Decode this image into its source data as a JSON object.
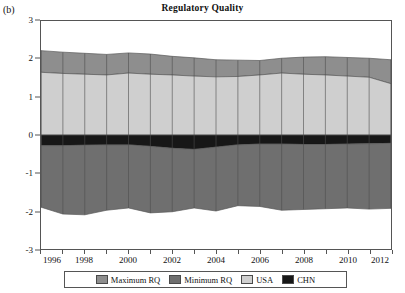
{
  "panel_label": "(b)",
  "chart_data": {
    "type": "area",
    "title": "Regulatory Quality",
    "xlabel": "",
    "ylabel": "",
    "xlim": [
      1996,
      2012
    ],
    "ylim": [
      -3,
      3
    ],
    "grid": false,
    "legend_position": "bottom",
    "x": [
      1996,
      1997,
      1998,
      1999,
      2000,
      2001,
      2002,
      2003,
      2004,
      2005,
      2006,
      2007,
      2008,
      2009,
      2010,
      2011,
      2012
    ],
    "x_tick_labels": [
      "1996",
      "1998",
      "2000",
      "2002",
      "2004",
      "2006",
      "2008",
      "2010",
      "2012"
    ],
    "x_tick_values": [
      1996,
      1998,
      2000,
      2002,
      2004,
      2006,
      2008,
      2010,
      2012
    ],
    "y_tick_labels": [
      "-3",
      "-2",
      "-1",
      "0",
      "1",
      "2",
      "3"
    ],
    "y_tick_values": [
      -3,
      -2,
      -1,
      0,
      1,
      2,
      3
    ],
    "series": [
      {
        "name": "Maximum RQ",
        "color": "#8e8e8e",
        "values": [
          2.22,
          2.18,
          2.15,
          2.12,
          2.16,
          2.13,
          2.07,
          2.03,
          1.98,
          1.97,
          1.96,
          2.02,
          2.05,
          2.06,
          2.04,
          2.02,
          1.98
        ]
      },
      {
        "name": "USA",
        "color": "#cfcfcf",
        "values": [
          1.65,
          1.62,
          1.6,
          1.58,
          1.63,
          1.6,
          1.58,
          1.55,
          1.53,
          1.54,
          1.58,
          1.63,
          1.6,
          1.58,
          1.55,
          1.52,
          1.35
        ]
      },
      {
        "name": "CHN",
        "color": "#171717",
        "values": [
          -0.28,
          -0.28,
          -0.27,
          -0.26,
          -0.26,
          -0.3,
          -0.35,
          -0.38,
          -0.32,
          -0.26,
          -0.24,
          -0.24,
          -0.25,
          -0.25,
          -0.24,
          -0.23,
          -0.22
        ]
      },
      {
        "name": "Minimum RQ",
        "color": "#6f6f6f",
        "values": [
          -1.9,
          -2.08,
          -2.1,
          -1.98,
          -1.92,
          -2.05,
          -2.02,
          -1.92,
          -2.0,
          -1.86,
          -1.88,
          -1.98,
          -1.96,
          -1.94,
          -1.92,
          -1.95,
          -1.93
        ]
      }
    ],
    "zero_reference": 0,
    "legend_entries": [
      "Maximum RQ",
      "Minimum RQ",
      "USA",
      "CHN"
    ],
    "legend_colors": [
      "#8e8e8e",
      "#6f6f6f",
      "#cfcfcf",
      "#171717"
    ]
  }
}
